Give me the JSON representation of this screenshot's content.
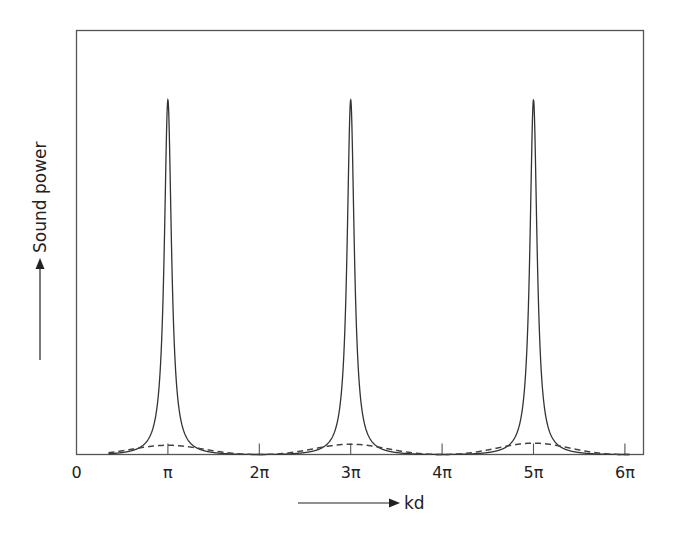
{
  "chart_data": {
    "type": "line",
    "title": "",
    "xlabel": "kd",
    "ylabel": "Sound power",
    "x_ticks": [
      {
        "value": 0,
        "label": "0"
      },
      {
        "value": 1,
        "label": "π"
      },
      {
        "value": 2,
        "label": "2π"
      },
      {
        "value": 3,
        "label": "3π"
      },
      {
        "value": 4,
        "label": "4π"
      },
      {
        "value": 5,
        "label": "5π"
      },
      {
        "value": 6,
        "label": "6π"
      }
    ],
    "x_unit": "pi",
    "xlim": [
      0,
      6.22
    ],
    "ylim": [
      0,
      1.08
    ],
    "y_ticks": [],
    "grid": false,
    "legend": null,
    "series": [
      {
        "name": "resonant (solid)",
        "style": "solid",
        "description": "Sharp resonance peaks at kd = pi, 3pi, 5pi, near zero at even multiples of pi",
        "peaks_at": [
          1,
          3,
          5
        ],
        "peak_value": 1.0,
        "x": [
          0,
          0.5,
          0.8,
          0.9,
          0.95,
          1.0,
          1.05,
          1.1,
          1.2,
          1.5,
          2.0,
          2.5,
          2.8,
          2.9,
          2.95,
          3.0,
          3.05,
          3.1,
          3.2,
          3.5,
          4.0,
          4.5,
          4.8,
          4.9,
          4.95,
          5.0,
          5.05,
          5.1,
          5.2,
          5.5,
          6.0
        ],
        "values": [
          0.0,
          0.011,
          0.06,
          0.2,
          0.5,
          1.0,
          0.5,
          0.2,
          0.06,
          0.011,
          0.0,
          0.011,
          0.06,
          0.2,
          0.5,
          1.0,
          0.5,
          0.2,
          0.06,
          0.011,
          0.0,
          0.011,
          0.06,
          0.2,
          0.5,
          1.0,
          0.5,
          0.2,
          0.06,
          0.011,
          0.0
        ]
      },
      {
        "name": "broad (dashed)",
        "style": "dashed",
        "description": "Low broad humps centred on odd multiples of pi, slightly increasing",
        "x": [
          0,
          0.5,
          1.0,
          1.5,
          2.0,
          2.5,
          3.0,
          3.5,
          4.0,
          4.5,
          5.0,
          5.5,
          6.0
        ],
        "values": [
          0.0,
          0.013,
          0.026,
          0.013,
          0.0,
          0.014,
          0.029,
          0.014,
          0.0,
          0.016,
          0.032,
          0.016,
          0.0
        ]
      }
    ],
    "colors": {
      "solid": "#333333",
      "dashed": "#444444",
      "frame": "#555555"
    },
    "layout": {
      "frame": "box",
      "x_arrow": true,
      "y_arrow": true
    }
  }
}
